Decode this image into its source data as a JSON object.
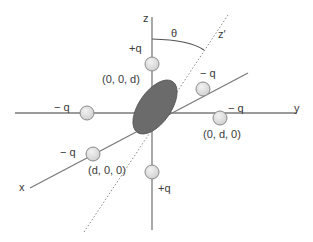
{
  "diagram": {
    "axes": {
      "z": "z",
      "y": "y",
      "x": "x",
      "z_prime": "z′",
      "theta": "θ"
    },
    "charges": [
      {
        "id": "top",
        "charge": "+q",
        "coord": "(0, 0, d)"
      },
      {
        "id": "bottom",
        "charge": "+q",
        "coord": ""
      },
      {
        "id": "left",
        "charge": "− q",
        "coord": ""
      },
      {
        "id": "right",
        "charge": "− q",
        "coord": "(0, d, 0)"
      },
      {
        "id": "front",
        "charge": "− q",
        "coord": "(d, 0, 0)"
      },
      {
        "id": "back",
        "charge": "− q",
        "coord": ""
      }
    ],
    "colors": {
      "axis": "#7a7a7a",
      "sphere_fill": "#dcdcdc",
      "sphere_stroke": "#8a8a8a",
      "ellipse_fill": "#6b6b6b",
      "text": "#3a3a3a"
    }
  }
}
